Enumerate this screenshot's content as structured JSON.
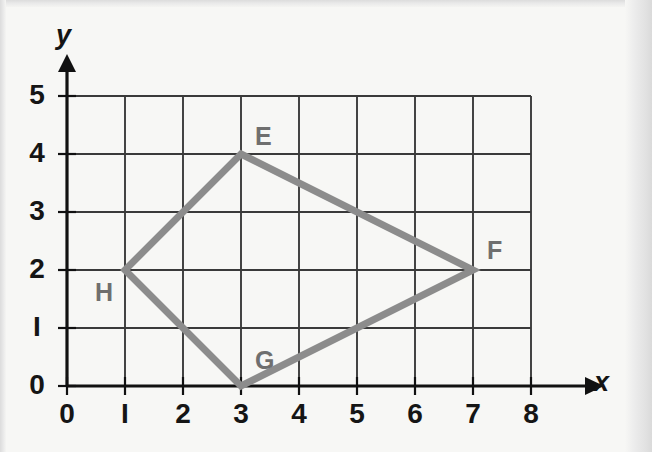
{
  "figure": {
    "background_color": "#f7f7f5",
    "axis_x_name": "x",
    "axis_y_name": "y"
  },
  "chart_data": {
    "type": "scatter",
    "title": "",
    "xlabel": "x",
    "ylabel": "y",
    "xlim": [
      0,
      8
    ],
    "ylim": [
      0,
      5
    ],
    "grid": true,
    "grid_spacing": 1,
    "legend": "none",
    "x_tick_labels": [
      "0",
      "I",
      "2",
      "3",
      "4",
      "5",
      "6",
      "7",
      "8"
    ],
    "x_tick_values": [
      0,
      1,
      2,
      3,
      4,
      5,
      6,
      7,
      8
    ],
    "y_tick_labels": [
      "0",
      "I",
      "2",
      "3",
      "4",
      "5"
    ],
    "y_tick_values": [
      0,
      1,
      2,
      3,
      4,
      5
    ],
    "shape_name": "EFGH",
    "shape_color": "#8c8c8c",
    "shape_closed": true,
    "points": [
      {
        "label": "E",
        "x": 3,
        "y": 4,
        "label_dx": 14,
        "label_dy": -30
      },
      {
        "label": "F",
        "x": 7,
        "y": 2,
        "label_dx": 14,
        "label_dy": -32
      },
      {
        "label": "G",
        "x": 3,
        "y": 0,
        "label_dx": 14,
        "label_dy": -38
      },
      {
        "label": "H",
        "x": 1,
        "y": 2,
        "label_dx": -30,
        "label_dy": 10
      }
    ],
    "annotations": []
  },
  "geometry": {
    "origin_px": {
      "x": 67,
      "y": 386
    },
    "cell_px": 58,
    "grid_line_color": "#3a3a3a",
    "axis_color": "#111111"
  }
}
